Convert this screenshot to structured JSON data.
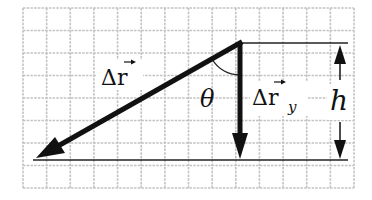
{
  "diagram": {
    "type": "vector-displacement",
    "colors": {
      "background": "#ffffff",
      "grid": "#bdbdbd",
      "ink": "#111111"
    },
    "grid": {
      "x0": 23,
      "y0": 8,
      "x1": 354,
      "y1": 188,
      "cols": 14,
      "rows": 8
    },
    "vertex": {
      "x": 240,
      "y": 43
    },
    "vectors": [
      {
        "id": "delta-r",
        "from": [
          240,
          43
        ],
        "to": [
          38,
          157
        ],
        "label": "Δr",
        "label_has_arrow": true
      },
      {
        "id": "delta-r-y",
        "from": [
          240,
          43
        ],
        "to": [
          240,
          158
        ],
        "label": "Δr",
        "subscript": "y",
        "label_has_arrow": true
      }
    ],
    "reference_lines": [
      {
        "id": "top-line",
        "from": [
          240,
          43
        ],
        "to": [
          348,
          43
        ]
      },
      {
        "id": "bottom-line",
        "from": [
          33,
          160
        ],
        "to": [
          348,
          160
        ]
      }
    ],
    "angle": {
      "label": "θ"
    },
    "dimension": {
      "label": "h"
    },
    "labels": {
      "delta_r": "Δr",
      "delta_r_y": "Δr",
      "delta_r_y_sub": "y",
      "theta": "θ",
      "h": "h"
    }
  }
}
